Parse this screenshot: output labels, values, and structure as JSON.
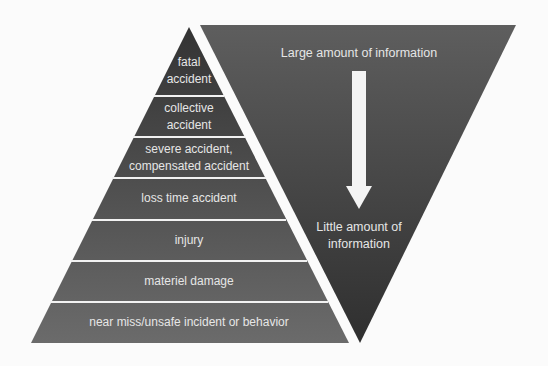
{
  "pyramid": {
    "title": "Accident pyramid",
    "levels": [
      {
        "lines": [
          "fatal",
          "accident"
        ]
      },
      {
        "lines": [
          "collective",
          "accident"
        ]
      },
      {
        "lines": [
          "severe accident,",
          "compensated accident"
        ]
      },
      {
        "lines": [
          "loss time accident"
        ]
      },
      {
        "lines": [
          "injury"
        ]
      },
      {
        "lines": [
          "materiel damage"
        ]
      },
      {
        "lines": [
          "near miss/unsafe incident or behavior"
        ]
      }
    ],
    "colors": {
      "top": "#333333",
      "bottom": "#6b6b6b",
      "separator": "#f2f2f2"
    }
  },
  "funnel": {
    "top_label": "Large amount of information",
    "bottom_label_lines": [
      "Little amount of",
      "information"
    ],
    "arrow": "down-arrow",
    "colors": {
      "top": "#5e5e5e",
      "bottom": "#2f2f2f",
      "arrow": "#f4f4f4"
    }
  }
}
